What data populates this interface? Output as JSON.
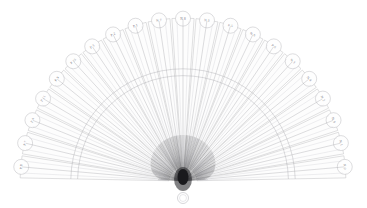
{
  "figure": {
    "background_color": "#ffffff",
    "line_color": "#b9b9bd",
    "hub_color": "#1a1a1d",
    "label_color": "#74747c"
  },
  "geometry": {
    "hub_x": 183,
    "hub_y": 181,
    "inner_radius": 14,
    "outer_radius": 170,
    "tip_radius": 7.5,
    "start_angle_deg": 185,
    "end_angle_deg": 355,
    "blade_count": 21,
    "rivet_radius": 5.5,
    "rivet_center_x": 183,
    "rivet_center_y": 198
  },
  "blades": [
    {
      "index": 1,
      "label": "P 8"
    },
    {
      "index": 2,
      "label": "P 7"
    },
    {
      "index": 3,
      "label": "P 4"
    },
    {
      "index": 4,
      "label": "P 11"
    },
    {
      "index": 5,
      "label": "P 9"
    },
    {
      "index": 6,
      "label": "P 10"
    },
    {
      "index": 7,
      "label": "P 3"
    },
    {
      "index": 8,
      "label": "P 2"
    },
    {
      "index": 9,
      "label": "P 1"
    },
    {
      "index": 10,
      "label": "N 7"
    },
    {
      "index": 11,
      "label": "N 8"
    },
    {
      "index": 12,
      "label": "N 5"
    },
    {
      "index": 13,
      "label": "P 5"
    },
    {
      "index": 14,
      "label": "N 6"
    },
    {
      "index": 15,
      "label": "P 6"
    },
    {
      "index": 16,
      "label": "N 3"
    },
    {
      "index": 17,
      "label": "N 4"
    },
    {
      "index": 18,
      "label": "N 2"
    },
    {
      "index": 19,
      "label": "N 9"
    },
    {
      "index": 20,
      "label": "N 1"
    },
    {
      "index": 21,
      "label": "N 0"
    }
  ]
}
